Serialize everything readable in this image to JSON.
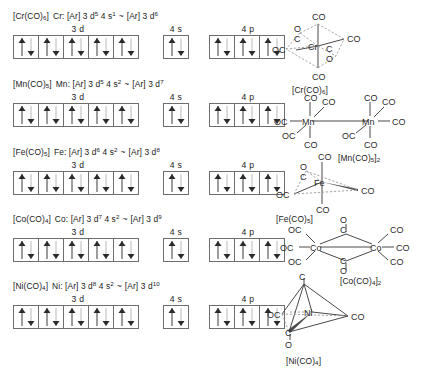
{
  "diagram": {
    "orbital_labels": {
      "d": "3 d",
      "s": "4 s",
      "p": "4 p"
    },
    "arrow_up": "up-arrow",
    "arrow_down": "down-arrow"
  },
  "rows": [
    {
      "id": "cr",
      "complex": "[Cr(CO)",
      "complex_sub": "6",
      "complex_end": "]",
      "element": "Cr:",
      "core": "[Ar]",
      "d_label": "3 d",
      "d_count": "5",
      "s_label": "4 s",
      "s_count": "1",
      "tilde": "~",
      "core2": "[Ar]",
      "d2_label": "3 d",
      "d2_count": "6",
      "orbitals_3d": [
        "ud",
        "ud",
        "ud",
        "ud",
        "ud"
      ],
      "orbitals_4s": [
        "ud"
      ],
      "orbitals_4p": [
        "ud",
        "ud",
        "ud"
      ]
    },
    {
      "id": "mn",
      "complex": "[Mn(CO)",
      "complex_sub": "5",
      "complex_end": "]",
      "element": "Mn:",
      "core": "[Ar]",
      "d_label": "3 d",
      "d_count": "5",
      "s_label": "4 s",
      "s_count": "2",
      "tilde": "~",
      "core2": "[Ar]",
      "d2_label": "3 d",
      "d2_count": "7",
      "orbitals_3d": [
        "ud",
        "ud",
        "ud",
        "ud",
        "ud"
      ],
      "orbitals_4s": [
        "ud"
      ],
      "orbitals_4p": [
        "ud",
        "ud",
        "ud"
      ]
    },
    {
      "id": "fe",
      "complex": "[Fe(CO)",
      "complex_sub": "5",
      "complex_end": "]",
      "element": "Fe:",
      "core": "[Ar]",
      "d_label": "3 d",
      "d_count": "6",
      "s_label": "4 s",
      "s_count": "2",
      "tilde": "~",
      "core2": "[Ar]",
      "d2_label": "3 d",
      "d2_count": "8",
      "orbitals_3d": [
        "ud",
        "ud",
        "ud",
        "ud",
        "ud"
      ],
      "orbitals_4s": [
        "ud"
      ],
      "orbitals_4p": [
        "ud",
        "ud",
        "ud"
      ]
    },
    {
      "id": "co",
      "complex": "[Co(CO)",
      "complex_sub": "4",
      "complex_end": "]",
      "element": "Co:",
      "core": "[Ar]",
      "d_label": "3 d",
      "d_count": "7",
      "s_label": "4 s",
      "s_count": "2",
      "tilde": "~",
      "core2": "[Ar]",
      "d2_label": "3 d",
      "d2_count": "9",
      "orbitals_3d": [
        "ud",
        "ud",
        "ud",
        "ud",
        "ud"
      ],
      "orbitals_4s": [
        "ud"
      ],
      "orbitals_4p": [
        "ud",
        "ud",
        "ud"
      ]
    },
    {
      "id": "ni",
      "complex": "[Ni(CO)",
      "complex_sub": "4",
      "complex_end": "]",
      "element": "Ni:",
      "core": "[Ar]",
      "d_label": "3 d",
      "d_count": "8",
      "s_label": "4 s",
      "s_count": "2",
      "tilde": "~",
      "core2": "[Ar]",
      "d2_label": "3 d",
      "d2_count": "10",
      "orbitals_3d": [
        "ud",
        "ud",
        "ud",
        "ud",
        "ud"
      ],
      "orbitals_4s": [
        "ud"
      ],
      "orbitals_4p": [
        "ud",
        "ud",
        "ud"
      ]
    }
  ],
  "structures": {
    "cr": {
      "center": "Cr",
      "caption": "[Cr(CO)",
      "caption_sub": "6",
      "caption_end": "]",
      "ligands": [
        "CO",
        "CO",
        "OC",
        "CO",
        "C",
        "O",
        "C",
        "O"
      ],
      "geometry": "octahedral"
    },
    "mn": {
      "center_left": "Mn",
      "center_right": "Mn",
      "caption": "[Mn(CO)",
      "caption_sub": "5",
      "caption_end": "]",
      "caption_sub2": "2",
      "ligands": [
        "CO",
        "CO",
        "OC",
        "OC",
        "CO",
        "CO",
        "CO",
        "CO",
        "OC",
        "CO"
      ],
      "geometry": "metal-metal bonded dimer"
    },
    "fe": {
      "center": "Fe",
      "caption": "[Fe(CO)",
      "caption_sub": "5",
      "caption_end": "]",
      "ligands": [
        "CO",
        "CO",
        "OC",
        "CO",
        "C",
        "O"
      ],
      "geometry": "trigonal bipyramidal"
    },
    "co": {
      "center_left": "Co",
      "center_right": "Co",
      "caption": "[Co(CO)",
      "caption_sub": "4",
      "caption_end": "]",
      "caption_sub2": "2",
      "ligands": [
        "OC",
        "OC",
        "OC",
        "CO",
        "CO",
        "CO",
        "O",
        "C",
        "C",
        "O"
      ],
      "geometry": "carbonyl-bridged dimer"
    },
    "ni": {
      "center": "Ni",
      "caption": "[Ni(CO)",
      "caption_sub": "4",
      "caption_end": "]",
      "ligands": [
        "C",
        "O",
        "OC",
        "CO",
        "C",
        "O"
      ],
      "geometry": "tetrahedral"
    }
  }
}
